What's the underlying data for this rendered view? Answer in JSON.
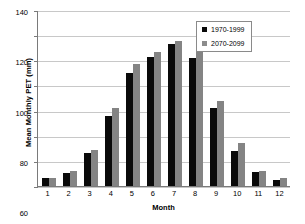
{
  "chart_data": {
    "type": "bar",
    "title": "",
    "xlabel": "Month",
    "ylabel": "Mean Monthly PET (mm)",
    "categories": [
      "1",
      "2",
      "3",
      "4",
      "5",
      "6",
      "7",
      "8",
      "9",
      "10",
      "11",
      "12"
    ],
    "ylim": [
      0,
      140
    ],
    "yticks": [
      0,
      20,
      40,
      60,
      80,
      100,
      120,
      140
    ],
    "grid": true,
    "legend_position": "top-right",
    "series": [
      {
        "name": "1970-1999",
        "color": "#0a0a0a",
        "values": [
          6,
          10,
          26,
          56,
          90,
          103,
          113,
          102,
          62,
          28,
          11,
          5
        ]
      },
      {
        "name": "2070-2099",
        "color": "#848484",
        "values": [
          6,
          12,
          29,
          62,
          97,
          107,
          115,
          107,
          68,
          34,
          12,
          6
        ]
      }
    ]
  }
}
